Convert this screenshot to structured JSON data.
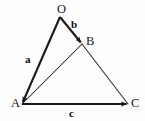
{
  "figure": {
    "background_color": "#fdfdfd",
    "stroke_color": "#1a1a1a",
    "thin_stroke_color": "#2b2b2b",
    "width": 145,
    "height": 121
  },
  "points": {
    "O": {
      "label": "O",
      "x": 60,
      "y": 17
    },
    "B": {
      "label": "B",
      "x": 82,
      "y": 44
    },
    "A": {
      "label": "A",
      "x": 22,
      "y": 104
    },
    "C": {
      "label": "C",
      "x": 128,
      "y": 104
    }
  },
  "vectors": {
    "a": {
      "label": "a",
      "from": "O",
      "to": "A",
      "style": "thick-arrow"
    },
    "b": {
      "label": "b",
      "from": "O",
      "to": "B",
      "style": "thick-arrow"
    },
    "c": {
      "label": "c",
      "from": "A",
      "to": "C",
      "style": "thick-arrow"
    }
  },
  "edges": [
    {
      "name": "A-B",
      "from": "A",
      "to": "B",
      "style": "thin-line"
    },
    {
      "name": "B-C",
      "from": "B",
      "to": "C",
      "style": "thin-line"
    }
  ],
  "chart_data": {
    "type": "scatter",
    "xlabel": "",
    "ylabel": "",
    "categories": [
      "O",
      "B",
      "A",
      "C"
    ],
    "x": [
      60,
      82,
      22,
      128
    ],
    "y": [
      17,
      44,
      104,
      104
    ],
    "series": [
      {
        "name": "a",
        "values": [
          60,
          17,
          22,
          104
        ]
      },
      {
        "name": "b",
        "values": [
          60,
          17,
          82,
          44
        ]
      },
      {
        "name": "c",
        "values": [
          22,
          104,
          128,
          104
        ]
      }
    ],
    "annotations": [
      "O",
      "B",
      "A",
      "C",
      "a",
      "b",
      "c"
    ],
    "grid": false,
    "legend": "none"
  }
}
